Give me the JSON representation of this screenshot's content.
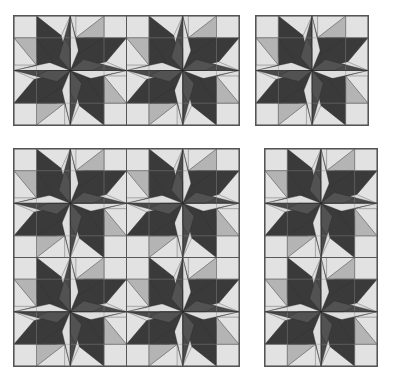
{
  "image": {
    "subject": "Quilt layout previews of an eight-point pinwheel star block",
    "panels": [
      {
        "id": "top-left",
        "columns": 2,
        "rows": 1
      },
      {
        "id": "top-right",
        "columns": 1,
        "rows": 1
      },
      {
        "id": "bottom-left",
        "columns": 2,
        "rows": 2
      },
      {
        "id": "bottom-right",
        "columns": 1,
        "rows": 2
      }
    ]
  },
  "colors": {
    "background": "#dedede",
    "light": "#e2e2e2",
    "medium": "#b4b4b4",
    "star_dark": "#3a3a3a",
    "star_mid": "#4a4a4a",
    "star_center": "#525252",
    "seam": "#222222",
    "border": "#555555"
  }
}
